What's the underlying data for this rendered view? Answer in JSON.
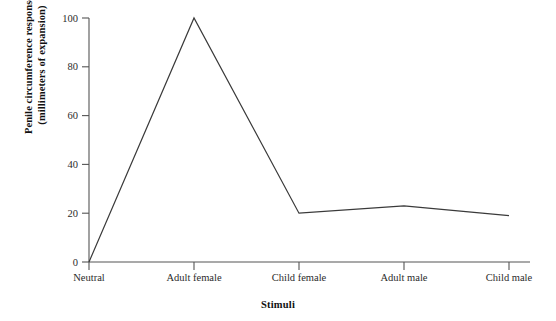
{
  "chart_data": {
    "type": "line",
    "title": "",
    "subtitle": "",
    "xlabel": "Stimuli",
    "ylabel": "Penile circumference response (millimeters of expansion)",
    "ylabel_line1": "Penile circumference response",
    "ylabel_line2": "(millimeters of expansion)",
    "categories": [
      "Neutral",
      "Adult female",
      "Child female",
      "Adult male",
      "Child male"
    ],
    "values": [
      0,
      100,
      20,
      23,
      19
    ],
    "series": [
      {
        "name": "Penile circumference response",
        "values": [
          0,
          100,
          20,
          23,
          19
        ]
      }
    ],
    "yticks": [
      0,
      20,
      40,
      60,
      80,
      100
    ],
    "ytick_labels": [
      "0",
      "20",
      "40",
      "60",
      "80",
      "100"
    ],
    "ylim": [
      0,
      100
    ],
    "grid": false,
    "legend": false,
    "legend_position": "none",
    "line_color": "#3a3a3a",
    "axis_color": "#555555",
    "background_color": "#ffffff",
    "markers": false
  }
}
